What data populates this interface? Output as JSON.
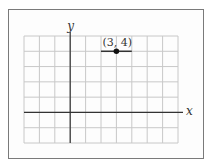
{
  "chart_data": {
    "type": "scatter",
    "title": "",
    "xlabel": "x",
    "ylabel": "y",
    "xlim": [
      -3,
      7
    ],
    "ylim": [
      -2,
      5
    ],
    "grid": true,
    "grid_step": 1,
    "points": [
      {
        "x": 3,
        "y": 4,
        "label": "(3, 4)"
      }
    ],
    "segments": [
      {
        "x1": 2,
        "y1": 4,
        "x2": 4,
        "y2": 4
      }
    ],
    "legend": null
  },
  "labels": {
    "x_axis": "x",
    "y_axis": "y",
    "point": "(3, 4)"
  },
  "colors": {
    "grid": "#c8c8c8",
    "axis": "#333333",
    "point": "#111111",
    "segment": "#333333",
    "frame": "#7a7a7a"
  }
}
